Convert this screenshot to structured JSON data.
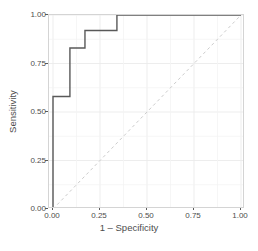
{
  "chart_data": {
    "type": "line",
    "title": "",
    "subtitle": "",
    "xlabel": "1 – Specificity",
    "ylabel": "Sensitivity",
    "xlim": [
      0,
      1
    ],
    "ylim": [
      0,
      1
    ],
    "grid": true,
    "legend": "none",
    "x_ticks": [
      "0.00",
      "0.25",
      "0.50",
      "0.75",
      "1.00"
    ],
    "x_tick_values": [
      0,
      0.25,
      0.5,
      0.75,
      1
    ],
    "y_ticks": [
      "0.00",
      "0.25",
      "0.50",
      "0.75",
      "1.00"
    ],
    "y_tick_values": [
      0,
      0.25,
      0.5,
      0.75,
      1
    ],
    "series": [
      {
        "name": "ROC curve",
        "style": "step",
        "color": "#595959",
        "linewidth": 1.4,
        "dash": "solid",
        "x": [
          0,
          0,
          0.09,
          0.09,
          0.17,
          0.17,
          0.34,
          0.34,
          1
        ],
        "y": [
          0,
          0.58,
          0.58,
          0.83,
          0.83,
          0.92,
          0.92,
          1,
          1
        ]
      },
      {
        "name": "Chance reference line",
        "style": "line",
        "color": "#cccccc",
        "linewidth": 1,
        "dash": "dashed",
        "x": [
          0,
          1
        ],
        "y": [
          0,
          1
        ]
      }
    ],
    "panel": {
      "background": "#ffffff",
      "border_color": "#d4d4d4",
      "gridline_color": "#ebebeb"
    }
  },
  "axes": {
    "x_title": "1 – Specificity",
    "y_title": "Sensitivity"
  }
}
